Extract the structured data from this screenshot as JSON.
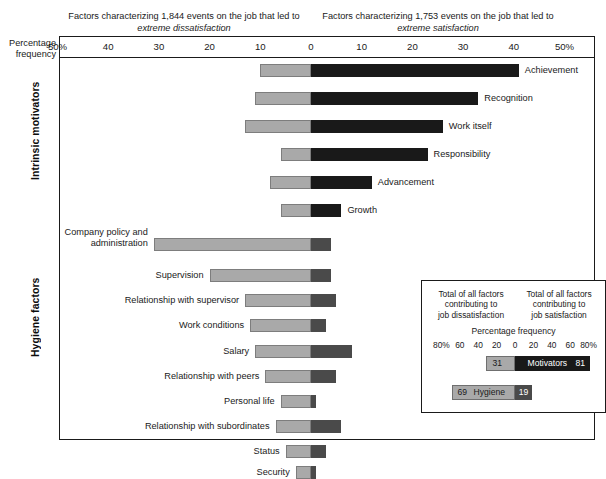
{
  "captions": {
    "left_line1": "Factors characterizing 1,844 events on the job that led to",
    "left_line2": "extreme dissatisfaction",
    "right_line1": "Factors characterizing 1,753 events on the job that led to",
    "right_line2": "extreme satisfaction"
  },
  "axis_label": {
    "line1": "Percentage",
    "line2": "frequency"
  },
  "groups": {
    "intrinsic": "Intrinsic motivators",
    "hygiene": "Hygiene factors"
  },
  "inset": {
    "cap_left_l1": "Total of all factors",
    "cap_left_l2": "contributing to",
    "cap_left_l3": "job dissatisfaction",
    "cap_right_l1": "Total of all factors",
    "cap_right_l2": "contributing to",
    "cap_right_l3": "job satisfaction",
    "pct_title": "Percentage frequency",
    "motivators_name": "Motivators",
    "hygiene_name": "Hygiene",
    "motivators_dis": "31",
    "motivators_sat": "81",
    "hygiene_dis": "69",
    "hygiene_sat": "19"
  },
  "colors": {
    "dissatisfaction_bar": "#a9a9a9",
    "satisfaction_motivators_bar": "#191919",
    "satisfaction_hygiene_bar": "#4a4a4a",
    "frame": "#1a1a1a",
    "background": "#ffffff"
  },
  "chart_data": {
    "type": "bar",
    "subtitle": "Factors characterizing 1,844 events on the job that led to extreme dissatisfaction; Factors characterizing 1,753 events on the job that led to extreme satisfaction",
    "xlabel": "Percentage frequency",
    "ylabel": "",
    "orientation": "horizontal-diverging",
    "xlim": [
      -50,
      50
    ],
    "xticks_left": [
      "50%",
      "40",
      "30",
      "20",
      "10",
      "0"
    ],
    "xticks_right": [
      "0",
      "10",
      "20",
      "30",
      "40",
      "50%"
    ],
    "grid": false,
    "legend_position": "inset-bottom-right",
    "series": [
      {
        "name": "extreme dissatisfaction",
        "color": "#a9a9a9"
      },
      {
        "name": "extreme satisfaction",
        "color": "#191919"
      }
    ],
    "categories": [
      {
        "label": "Achievement",
        "group": "Intrinsic motivators",
        "dissatisfaction": 10,
        "satisfaction": 41
      },
      {
        "label": "Recognition",
        "group": "Intrinsic motivators",
        "dissatisfaction": 11,
        "satisfaction": 33
      },
      {
        "label": "Work itself",
        "group": "Intrinsic motivators",
        "dissatisfaction": 13,
        "satisfaction": 26
      },
      {
        "label": "Responsibility",
        "group": "Intrinsic motivators",
        "dissatisfaction": 6,
        "satisfaction": 23
      },
      {
        "label": "Advancement",
        "group": "Intrinsic motivators",
        "dissatisfaction": 8,
        "satisfaction": 12
      },
      {
        "label": "Growth",
        "group": "Intrinsic motivators",
        "dissatisfaction": 6,
        "satisfaction": 6
      },
      {
        "label": "Company policy and administration",
        "group": "Hygiene factors",
        "dissatisfaction": 31,
        "satisfaction": 4
      },
      {
        "label": "Supervision",
        "group": "Hygiene factors",
        "dissatisfaction": 20,
        "satisfaction": 4
      },
      {
        "label": "Relationship with supervisor",
        "group": "Hygiene factors",
        "dissatisfaction": 13,
        "satisfaction": 5
      },
      {
        "label": "Work conditions",
        "group": "Hygiene factors",
        "dissatisfaction": 12,
        "satisfaction": 3
      },
      {
        "label": "Salary",
        "group": "Hygiene factors",
        "dissatisfaction": 11,
        "satisfaction": 8
      },
      {
        "label": "Relationship with peers",
        "group": "Hygiene factors",
        "dissatisfaction": 9,
        "satisfaction": 5
      },
      {
        "label": "Personal life",
        "group": "Hygiene factors",
        "dissatisfaction": 6,
        "satisfaction": 1
      },
      {
        "label": "Relationship with subordinates",
        "group": "Hygiene factors",
        "dissatisfaction": 7,
        "satisfaction": 6
      },
      {
        "label": "Status",
        "group": "Hygiene factors",
        "dissatisfaction": 5,
        "satisfaction": 3
      },
      {
        "label": "Security",
        "group": "Hygiene factors",
        "dissatisfaction": 3,
        "satisfaction": 1
      }
    ],
    "inset_summary": {
      "type": "bar",
      "title": "Percentage frequency",
      "xlim": [
        -80,
        80
      ],
      "xticks_left": [
        "80%",
        "60",
        "40",
        "20",
        "0"
      ],
      "xticks_right": [
        "20",
        "40",
        "60",
        "80%"
      ],
      "rows": [
        {
          "name": "Motivators",
          "dissatisfaction": 31,
          "satisfaction": 81
        },
        {
          "name": "Hygiene",
          "dissatisfaction": 69,
          "satisfaction": 19
        }
      ]
    }
  }
}
